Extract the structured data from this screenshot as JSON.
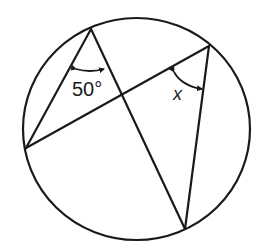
{
  "diagram": {
    "type": "circle-inscribed-angles",
    "circle": {
      "cx": 136.5,
      "cy": 129,
      "rx": 113.5,
      "ry": 111
    },
    "points": {
      "top": {
        "x": 91,
        "y": 29
      },
      "right": {
        "x": 209,
        "y": 46
      },
      "left": {
        "x": 26,
        "y": 148
      },
      "bottom": {
        "x": 185,
        "y": 229
      },
      "intersection": {
        "x": 122,
        "y": 95
      }
    },
    "chords": [
      {
        "from": "top",
        "to": "left"
      },
      {
        "from": "top",
        "to": "bottom"
      },
      {
        "from": "left",
        "to": "right"
      },
      {
        "from": "right",
        "to": "bottom"
      }
    ],
    "angles": [
      {
        "vertex": "top",
        "label": "50°",
        "value_deg": 50
      },
      {
        "vertex": "right",
        "label": "x",
        "value_deg": null
      }
    ],
    "stroke_color": "#1a1a1a",
    "background": "#ffffff"
  }
}
